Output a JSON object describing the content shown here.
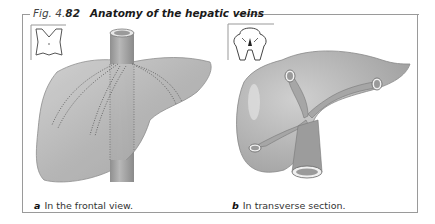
{
  "figure": {
    "label": "Fig. 4.",
    "number": "82",
    "title": "Anatomy of the hepatic veins"
  },
  "panels": [
    {
      "letter": "a",
      "caption": "In the frontal view.",
      "image": "liver-frontal-view-illustration",
      "inset": "torso-orientation-icon"
    },
    {
      "letter": "b",
      "caption": "In transverse section.",
      "image": "liver-transverse-section-illustration",
      "inset": "transverse-section-orientation-icon"
    }
  ],
  "colors": {
    "liver": "#b4b4b4",
    "liver_highlight": "#d8d8d8",
    "vessel": "#a8a8a8",
    "border": "#9a9a9a"
  }
}
